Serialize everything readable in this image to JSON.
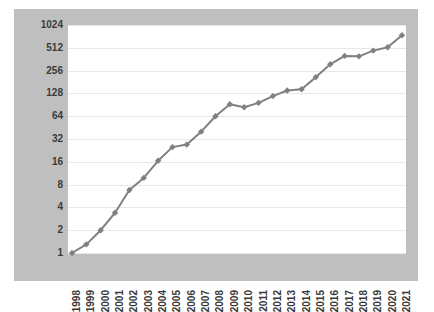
{
  "chart_data": {
    "type": "line",
    "title": "",
    "subtitle": "",
    "xlabel": "",
    "ylabel": "",
    "yscale": "log2",
    "ylim": [
      1,
      1024
    ],
    "grid": true,
    "legend": null,
    "legend_position": "none",
    "line_color": "#808080",
    "marker_color": "#808080",
    "marker": "diamond",
    "plot_background": "#ffffff",
    "figure_background": "#bfbfbf",
    "gridline_color": "#e8e8e8",
    "categories": [
      "1998",
      "1999",
      "2000",
      "2001",
      "2002",
      "2003",
      "2004",
      "2005",
      "2006",
      "2007",
      "2008",
      "2009",
      "2010",
      "2011",
      "2012",
      "2013",
      "2014",
      "2015",
      "2016",
      "2017",
      "2018",
      "2019",
      "2020",
      "2021"
    ],
    "values": [
      1,
      1.3,
      2,
      3.4,
      6.8,
      9.8,
      16.5,
      25,
      27,
      40,
      64,
      92,
      84,
      96,
      118,
      140,
      145,
      210,
      310,
      400,
      395,
      470,
      520,
      750
    ],
    "ytick_labels": [
      "1",
      "2",
      "4",
      "8",
      "16",
      "32",
      "64",
      "128",
      "256",
      "512",
      "1024"
    ],
    "ytick_values": [
      1,
      2,
      4,
      8,
      16,
      32,
      64,
      128,
      256,
      512,
      1024
    ]
  }
}
